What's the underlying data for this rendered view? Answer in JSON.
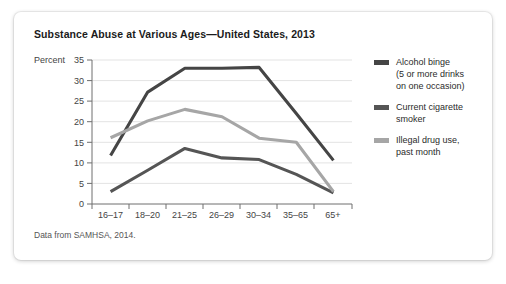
{
  "card": {
    "title": "Substance Abuse at Various Ages—United States, 2013",
    "source_note": "Data from SAMHSA, 2014."
  },
  "chart_data": {
    "type": "line",
    "title": "Substance Abuse at Various Ages—United States, 2013",
    "xlabel": "Age group",
    "ylabel": "Percent",
    "categories": [
      "16–17",
      "18–20",
      "21–25",
      "26–29",
      "30–34",
      "35–65",
      "65+"
    ],
    "ylim": [
      0,
      35
    ],
    "yticks": [
      0,
      5,
      10,
      15,
      20,
      25,
      30,
      35
    ],
    "grid": true,
    "legend_position": "right",
    "series": [
      {
        "name": "Alcohol binge (5 or more drinks on one occasion)",
        "legend_line_1": "Alcohol binge",
        "legend_line_2": "(5 or more drinks",
        "legend_line_3": "on one occasion)",
        "color": "#454545",
        "values": [
          11.8,
          27.2,
          33.0,
          33.0,
          33.2,
          22.0,
          10.6
        ]
      },
      {
        "name": "Current cigarette smoker",
        "legend_line_1": "Current cigarette",
        "legend_line_2": "smoker",
        "color": "#555555",
        "values": [
          3.0,
          8.2,
          13.5,
          11.2,
          10.8,
          7.2,
          2.7
        ]
      },
      {
        "name": "Illegal drug use, past month",
        "legend_line_1": "Illegal drug use,",
        "legend_line_2": "past month",
        "color": "#a6a6a6",
        "values": [
          16.1,
          20.2,
          23.0,
          21.2,
          16.0,
          15.0,
          3.0
        ]
      }
    ]
  }
}
